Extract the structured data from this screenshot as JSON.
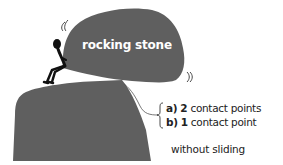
{
  "diagram": {
    "stone_label": "rocking stone",
    "options": [
      {
        "letter": "a)",
        "count": "2",
        "text": "contact points"
      },
      {
        "letter": "b)",
        "count": "1",
        "text": "contact point"
      }
    ],
    "note": "without sliding"
  },
  "colors": {
    "rock": "#5f5f5f",
    "figure": "#111111",
    "text": "#222222",
    "label": "#ffffff",
    "background": "#ffffff"
  },
  "icons": {
    "motion_left": "wobble-marks",
    "motion_right": "wobble-marks",
    "brace": "curly-brace"
  }
}
